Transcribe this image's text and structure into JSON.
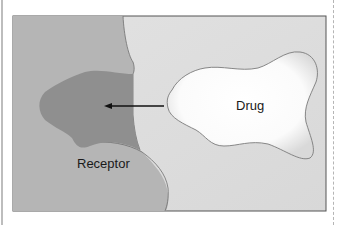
{
  "figure": {
    "labels": {
      "receptor": "Receptor",
      "drug": "Drug"
    },
    "colors": {
      "background_panel": "#dcdcdc",
      "receptor_body": "#b3b3b3",
      "binding_site": "#8f8f8f",
      "drug_fill": "#ffffff",
      "outline": "#6e6e6e",
      "arrow": "#111111"
    },
    "arrow": {
      "direction": "left",
      "from": "drug",
      "to": "binding-site"
    }
  }
}
